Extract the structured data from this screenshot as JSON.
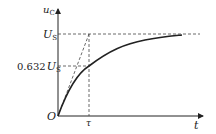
{
  "diagram": {
    "y_axis_label": "u",
    "y_axis_sub": "C",
    "x_axis_label": "t",
    "origin_label": "O",
    "tau_label": "τ",
    "us_label": "U",
    "us_sub": "S",
    "level_label_num": "0.632",
    "level_label_var": "U",
    "level_label_sub": "S"
  }
}
